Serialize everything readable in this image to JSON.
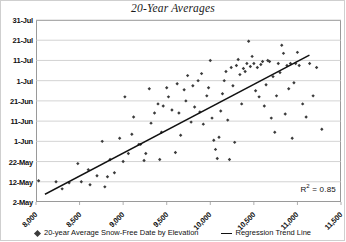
{
  "chart_data": {
    "type": "scatter",
    "title": "20-Year Averages",
    "xlabel": "",
    "ylabel": "",
    "xlim": [
      8000,
      11500
    ],
    "ylim": [
      0,
      90
    ],
    "grid": true,
    "legend_position": "bottom",
    "xticks": [
      "8,000",
      "8,500",
      "9,000",
      "9,500",
      "10,000",
      "10,500",
      "11,000",
      "11,500"
    ],
    "xtick_values": [
      8000,
      8500,
      9000,
      9500,
      10000,
      10500,
      11000,
      11500
    ],
    "yticks": [
      "2-May",
      "12-May",
      "22-May",
      "1-Jun",
      "11-Jun",
      "21-Jun",
      "1-Jul",
      "11-Jul",
      "21-Jul",
      "31-Jul"
    ],
    "ytick_values": [
      0,
      10,
      20,
      30,
      40,
      50,
      60,
      70,
      80,
      90
    ],
    "annotations": [
      {
        "name": "r-squared",
        "text": "R² = 0.85",
        "value": 0.85
      }
    ],
    "series": [
      {
        "name": "20-year Average Snow-Free Date by Elevation",
        "type": "scatter",
        "marker": "diamond",
        "color": "#3b3b3b",
        "points": [
          [
            8030,
            10.5
          ],
          [
            8230,
            10.0
          ],
          [
            8300,
            6.5
          ],
          [
            8380,
            9.5
          ],
          [
            8480,
            19.0
          ],
          [
            8520,
            10.0
          ],
          [
            8600,
            16.0
          ],
          [
            8620,
            8.5
          ],
          [
            8700,
            13.0
          ],
          [
            8760,
            30.0
          ],
          [
            8790,
            7.5
          ],
          [
            8820,
            12.5
          ],
          [
            8850,
            21.0
          ],
          [
            8900,
            14.5
          ],
          [
            8960,
            31.5
          ],
          [
            9000,
            20.0
          ],
          [
            9020,
            52.0
          ],
          [
            9060,
            24.0
          ],
          [
            9100,
            33.5
          ],
          [
            9120,
            42.0
          ],
          [
            9180,
            28.5
          ],
          [
            9200,
            28.5
          ],
          [
            9240,
            20.5
          ],
          [
            9260,
            24.0
          ],
          [
            9300,
            56.0
          ],
          [
            9320,
            39.0
          ],
          [
            9360,
            44.0
          ],
          [
            9400,
            48.5
          ],
          [
            9420,
            21.0
          ],
          [
            9440,
            34.5
          ],
          [
            9460,
            47.5
          ],
          [
            9500,
            56.5
          ],
          [
            9520,
            52.0
          ],
          [
            9560,
            45.5
          ],
          [
            9600,
            24.5
          ],
          [
            9620,
            58.5
          ],
          [
            9640,
            44.0
          ],
          [
            9660,
            33.0
          ],
          [
            9700,
            55.5
          ],
          [
            9720,
            50.0
          ],
          [
            9740,
            62.5
          ],
          [
            9780,
            39.5
          ],
          [
            9800,
            57.5
          ],
          [
            9820,
            47.0
          ],
          [
            9860,
            60.0
          ],
          [
            9880,
            44.5
          ],
          [
            9900,
            63.5
          ],
          [
            9920,
            38.5
          ],
          [
            9960,
            52.5
          ],
          [
            9980,
            56.5
          ],
          [
            10000,
            70.0
          ],
          [
            10020,
            41.5
          ],
          [
            10040,
            30.5
          ],
          [
            10060,
            26.0
          ],
          [
            10080,
            21.5
          ],
          [
            10100,
            32.0
          ],
          [
            10120,
            45.0
          ],
          [
            10140,
            53.5
          ],
          [
            10160,
            60.0
          ],
          [
            10180,
            64.5
          ],
          [
            10200,
            40.5
          ],
          [
            10220,
            21.0
          ],
          [
            10240,
            66.5
          ],
          [
            10260,
            57.5
          ],
          [
            10280,
            29.5
          ],
          [
            10300,
            67.5
          ],
          [
            10320,
            70.5
          ],
          [
            10340,
            63.0
          ],
          [
            10360,
            48.5
          ],
          [
            10380,
            66.0
          ],
          [
            10400,
            64.5
          ],
          [
            10420,
            68.5
          ],
          [
            10440,
            79.5
          ],
          [
            10460,
            67.0
          ],
          [
            10480,
            72.0
          ],
          [
            10500,
            68.5
          ],
          [
            10520,
            55.0
          ],
          [
            10540,
            66.5
          ],
          [
            10560,
            52.0
          ],
          [
            10580,
            68.0
          ],
          [
            10600,
            69.5
          ],
          [
            10620,
            47.5
          ],
          [
            10640,
            58.0
          ],
          [
            10660,
            70.0
          ],
          [
            10680,
            69.5
          ],
          [
            10700,
            41.5
          ],
          [
            10720,
            62.0
          ],
          [
            10740,
            34.5
          ],
          [
            10760,
            52.5
          ],
          [
            10780,
            68.5
          ],
          [
            10800,
            64.0
          ],
          [
            10820,
            77.5
          ],
          [
            10840,
            73.5
          ],
          [
            10860,
            43.5
          ],
          [
            10880,
            67.5
          ],
          [
            10900,
            56.0
          ],
          [
            10920,
            68.5
          ],
          [
            10940,
            31.5
          ],
          [
            10960,
            59.0
          ],
          [
            10980,
            68.5
          ],
          [
            11000,
            74.0
          ],
          [
            11020,
            67.5
          ],
          [
            11060,
            48.5
          ],
          [
            11100,
            42.0
          ],
          [
            11140,
            68.5
          ],
          [
            11180,
            52.5
          ],
          [
            11220,
            66.5
          ],
          [
            11280,
            36.0
          ]
        ]
      },
      {
        "name": "Regression Trend Line",
        "type": "line",
        "color": "#111111",
        "endpoints": [
          [
            8110,
            4.0
          ],
          [
            11130,
            72.5
          ]
        ]
      }
    ]
  },
  "legend": {
    "entries": [
      {
        "label": "20-year Average Snow-Free Date by Elevation",
        "marker": "diamond"
      },
      {
        "label": "Regression Trend Line",
        "marker": "line"
      }
    ]
  },
  "colors": {
    "marker": "#3b3b3b",
    "trendline": "#111111",
    "gridline": "#c8c8c8",
    "frame": "#9a9a9a",
    "text": "#111111"
  }
}
